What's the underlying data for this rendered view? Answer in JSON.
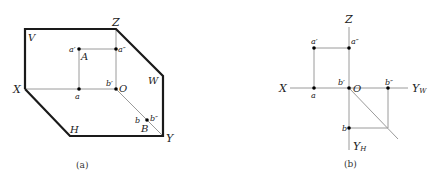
{
  "colors": {
    "frame": "#1a1a1a",
    "thin": "#9a9a9a",
    "point": "#000000",
    "text": "#222222"
  },
  "figure_a": {
    "caption": "(a)",
    "planes": {
      "V": "V",
      "H": "H",
      "W": "W"
    },
    "axes": {
      "X": "X",
      "Y": "Y",
      "Z": "Z",
      "O": "O"
    },
    "points": {
      "a_prime": "a′",
      "a_dprime": "a″",
      "a": "a",
      "A": "A",
      "b_prime": "b′",
      "b_dprime": "b″",
      "b": "b",
      "B": "B"
    }
  },
  "figure_b": {
    "caption": "(b)",
    "axes": {
      "X": "X",
      "Z": "Z",
      "O": "O",
      "Yw": "Y",
      "Yw_sub": "W",
      "Yh": "Y",
      "Yh_sub": "H"
    },
    "points": {
      "a_prime": "a′",
      "a_dprime": "a″",
      "a": "a",
      "b_prime": "b′",
      "b_dprime": "b″",
      "b": "b"
    }
  }
}
